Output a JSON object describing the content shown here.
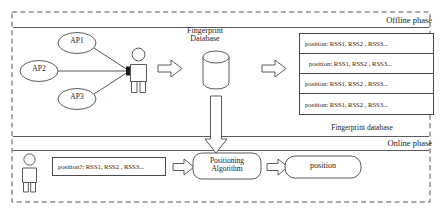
{
  "diagram": {
    "phases": {
      "offline": "Offline phase",
      "online": "Online phase"
    },
    "offline": {
      "access_points": [
        {
          "id": "ap1",
          "label": "AP1"
        },
        {
          "id": "ap2",
          "label": "AP2"
        },
        {
          "id": "ap3",
          "label": "AP3"
        }
      ],
      "user_icon": "person-icon",
      "database_title": "Fingerprint\nDatabase",
      "database_title_line1": "Fingerprint",
      "database_title_line2": "Database",
      "database_icon": "cylinder-database-icon",
      "table_caption": "Fingerprint database",
      "table_rows": [
        {
          "text": "position:  RSS1, RSS2 , RSS3..."
        },
        {
          "text": "position:  RSS1, RSS2 , RSS3..."
        },
        {
          "text": "position:  RSS1, RSS2 , RSS3..."
        },
        {
          "text": "position:  RSS1, RSS2 , RSS3..."
        }
      ]
    },
    "online": {
      "user_icon": "person-icon",
      "measurement": "position?:  RSS1, RSS2 , RSS3...",
      "algorithm_line1": "Positioning",
      "algorithm_line2": "Algorithm",
      "result": "position"
    },
    "colors": {
      "stroke": "#4a4a4a",
      "frame": "#555555",
      "text": "#1a1a1a",
      "background": "#ffffff"
    }
  }
}
